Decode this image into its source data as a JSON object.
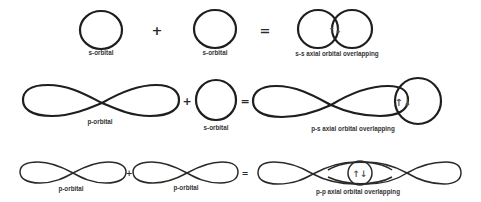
{
  "rows": [
    {
      "name": "s-s",
      "operands": [
        {
          "label": "s-orbital"
        },
        {
          "label": "s-orbital"
        }
      ],
      "plus": "+",
      "equals": "=",
      "result": {
        "label": "s-s axial orbital overlapping",
        "overlap_symbol": "↑↓"
      }
    },
    {
      "name": "p-s",
      "operands": [
        {
          "label": "p-orbital"
        },
        {
          "label": "s-orbital"
        }
      ],
      "plus": "+",
      "equals": "=",
      "result": {
        "label": "p-s axial orbital overlapping",
        "overlap_symbol": "↑↓"
      }
    },
    {
      "name": "p-p",
      "operands": [
        {
          "label": "p-orbital"
        },
        {
          "label": "p-orbital"
        }
      ],
      "plus": "+",
      "equals": "=",
      "result": {
        "label": "p-p axial orbital overlapping",
        "overlap_symbol": "↑↓"
      }
    }
  ],
  "colors": {
    "stroke": "#1e1e1e",
    "text": "#333333",
    "background": "#ffffff"
  }
}
